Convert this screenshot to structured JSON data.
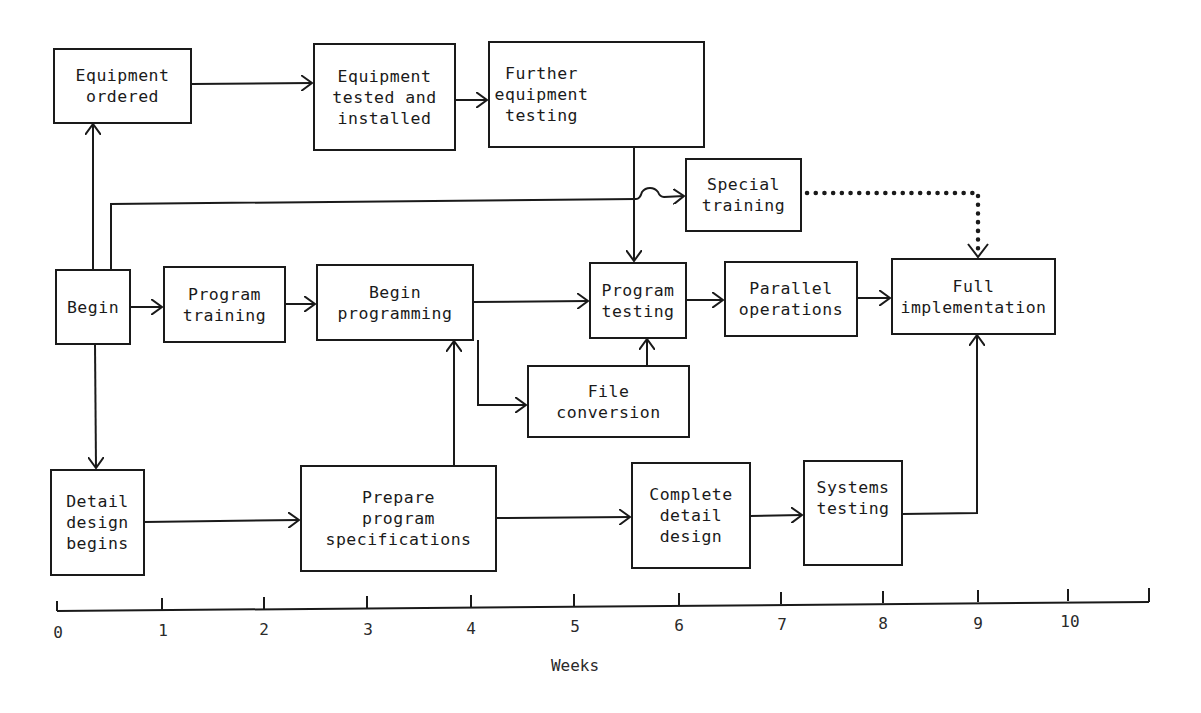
{
  "diagram": {
    "type": "network / PERT activity diagram",
    "nodes": [
      {
        "id": "begin",
        "label": "Begin"
      },
      {
        "id": "equipment_ordered",
        "label": "Equipment\nordered"
      },
      {
        "id": "equipment_tested",
        "label": "Equipment\ntested and\ninstalled"
      },
      {
        "id": "further_testing",
        "label": "Further\nequipment\ntesting"
      },
      {
        "id": "special_training",
        "label": "Special\ntraining"
      },
      {
        "id": "program_training",
        "label": "Program\ntraining"
      },
      {
        "id": "begin_programming",
        "label": "Begin\nprogramming"
      },
      {
        "id": "program_testing",
        "label": "Program\ntesting"
      },
      {
        "id": "parallel_operations",
        "label": "Parallel\noperations"
      },
      {
        "id": "full_implementation",
        "label": "Full\nimplementation"
      },
      {
        "id": "file_conversion",
        "label": "File\nconversion"
      },
      {
        "id": "detail_design_begins",
        "label": "Detail\ndesign\nbegins"
      },
      {
        "id": "prepare_specs",
        "label": "Prepare\nprogram\nspecifications"
      },
      {
        "id": "complete_detail_design",
        "label": "Complete\ndetail\ndesign"
      },
      {
        "id": "systems_testing",
        "label": "Systems\ntesting"
      }
    ],
    "edges": [
      {
        "from": "begin",
        "to": "equipment_ordered",
        "style": "solid"
      },
      {
        "from": "begin",
        "to": "special_training",
        "style": "solid"
      },
      {
        "from": "begin",
        "to": "program_training",
        "style": "solid"
      },
      {
        "from": "begin",
        "to": "detail_design_begins",
        "style": "solid"
      },
      {
        "from": "equipment_ordered",
        "to": "equipment_tested",
        "style": "solid"
      },
      {
        "from": "equipment_tested",
        "to": "further_testing",
        "style": "solid"
      },
      {
        "from": "further_testing",
        "to": "program_testing",
        "style": "solid"
      },
      {
        "from": "program_training",
        "to": "begin_programming",
        "style": "solid"
      },
      {
        "from": "begin_programming",
        "to": "program_testing",
        "style": "solid"
      },
      {
        "from": "begin_programming",
        "to": "file_conversion",
        "style": "solid"
      },
      {
        "from": "file_conversion",
        "to": "program_testing",
        "style": "solid"
      },
      {
        "from": "program_testing",
        "to": "parallel_operations",
        "style": "solid"
      },
      {
        "from": "parallel_operations",
        "to": "full_implementation",
        "style": "solid"
      },
      {
        "from": "special_training",
        "to": "full_implementation",
        "style": "dotted"
      },
      {
        "from": "detail_design_begins",
        "to": "prepare_specs",
        "style": "solid"
      },
      {
        "from": "prepare_specs",
        "to": "begin_programming",
        "style": "solid"
      },
      {
        "from": "prepare_specs",
        "to": "complete_detail_design",
        "style": "solid"
      },
      {
        "from": "complete_detail_design",
        "to": "systems_testing",
        "style": "solid"
      },
      {
        "from": "systems_testing",
        "to": "full_implementation",
        "style": "solid"
      }
    ]
  },
  "axis": {
    "label": "Weeks",
    "ticks": [
      "0",
      "1",
      "2",
      "3",
      "4",
      "5",
      "6",
      "7",
      "8",
      "9",
      "10"
    ]
  },
  "colors": {
    "ink": "#1a1a1a",
    "background": "#ffffff"
  }
}
